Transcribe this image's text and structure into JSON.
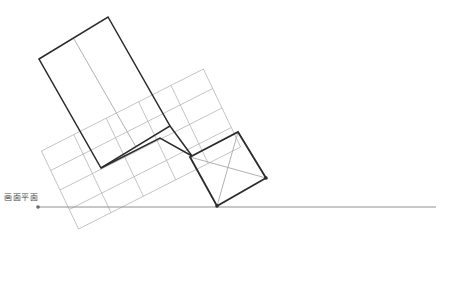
{
  "figure": {
    "title": "",
    "type": "technical-geometry-line-drawing",
    "canvas": {
      "width": 449,
      "height": 298,
      "background": "#ffffff"
    },
    "colors": {
      "bold_stroke": "#2b2b2b",
      "light_stroke": "#a8a8a8",
      "grid_stroke": "#b5b5b5",
      "baseline_stroke": "#909090",
      "label_text": "#4a4a4a"
    },
    "labels": [
      {
        "id": "picture-plane-label",
        "text": "画面平面",
        "x": 4,
        "y": 194
      }
    ],
    "baseline": {
      "name": "picture-plane-line",
      "x1": 38,
      "y1": 207,
      "x2": 436,
      "y2": 207,
      "start_dot": true,
      "dot_radius": 1.8
    },
    "upper_rectangle": {
      "name": "bold-upper-rectangle",
      "points": "39,59 108,17 170,126 101,168",
      "divider": {
        "x1": 74,
        "y1": 39,
        "x2": 136,
        "y2": 147
      }
    },
    "grid_plane": {
      "name": "rotated-grid-plane",
      "origin": {
        "x": 60,
        "y": 190
      },
      "u": {
        "dx": 32.4,
        "dy": -16.4
      },
      "v": {
        "dx": 9.3,
        "dy": 19.5
      },
      "cols": 5,
      "rows": 4,
      "outline": "60,190 222,108 260,187 98,269"
    },
    "diagonal_square": {
      "name": "bold-diagonal-square",
      "points": "190,157 238,132 266,178 217,206",
      "diagonals": [
        {
          "x1": 190,
          "y1": 157,
          "x2": 266,
          "y2": 178
        },
        {
          "x1": 238,
          "y1": 132,
          "x2": 217,
          "y2": 206
        }
      ],
      "vertex_dots": [
        {
          "x": 266,
          "y": 178
        },
        {
          "x": 217,
          "y": 206
        }
      ]
    },
    "bold_connector": {
      "name": "bold-grid-edge",
      "points": "101,168 160,138 192,156",
      "points2": "170,126 192,156"
    }
  }
}
